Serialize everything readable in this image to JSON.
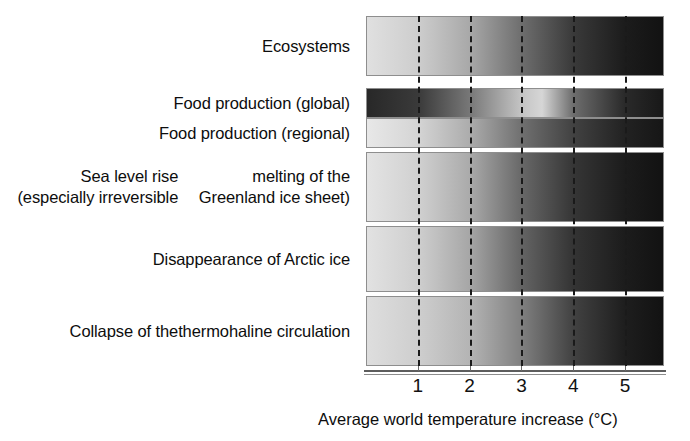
{
  "figure": {
    "type": "burning-embers-risk-diagram",
    "background": "#ffffff"
  },
  "axis": {
    "title": "Average world temperature increase (°C)",
    "tick_labels": [
      "1",
      "2",
      "3",
      "4",
      "5"
    ],
    "tick_values": [
      1,
      2,
      3,
      4,
      5
    ],
    "xlim": [
      0,
      5.75
    ],
    "unit": "°C",
    "gridline_style": "dashed",
    "gridline_color": "#1a1a1a",
    "axis_line_color": "#5d5d5d"
  },
  "rows": [
    {
      "label": "Ecosystems",
      "label_lines": [
        "Ecosystems"
      ],
      "top": 16,
      "height": 60
    },
    {
      "label": "Food production (global)",
      "label_lines": [
        "Food production (global)"
      ],
      "top": 88,
      "height": 30
    },
    {
      "label": "Food production (regional)",
      "label_lines": [
        "Food production (regional)"
      ],
      "top": 118,
      "height": 30
    },
    {
      "label": "Sea level rise (especially irreversible melting of the Greenland ice sheet)",
      "label_lines": [
        "Sea level rise (especially irreversible",
        "melting of the Greenland ice sheet)"
      ],
      "top": 152,
      "height": 70
    },
    {
      "label": "Disappearance of Arctic ice",
      "label_lines": [
        "Disappearance of Arctic ice"
      ],
      "top": 226,
      "height": 66
    },
    {
      "label": "Collapse of the thermohaline circulation",
      "label_lines": [
        "Collapse of the",
        "thermohaline circulation"
      ],
      "top": 296,
      "height": 70
    }
  ],
  "chart_data": {
    "type": "heatmap",
    "title": "",
    "subtitle": "",
    "xlabel": "Average world temperature increase (°C)",
    "ylabel": "",
    "xlim": [
      0,
      5.75
    ],
    "xticks": [
      1,
      2,
      3,
      4,
      5
    ],
    "xticklabels": [
      "1",
      "2",
      "3",
      "4",
      "5"
    ],
    "grid": true,
    "legend": "none",
    "colormap": "grayscale (light = low risk / benefit, dark = high risk)",
    "categories": [
      "Ecosystems",
      "Food production (global)",
      "Food production (regional)",
      "Sea level rise (especially irreversible melting of the Greenland ice sheet)",
      "Disappearance of Arctic ice",
      "Collapse of the thermohaline circulation"
    ],
    "series": [
      {
        "name": "Ecosystems",
        "gradient_stops": [
          {
            "x": 0.0,
            "gray": 224
          },
          {
            "x": 1.0,
            "gray": 205
          },
          {
            "x": 2.0,
            "gray": 168
          },
          {
            "x": 3.0,
            "gray": 110
          },
          {
            "x": 4.0,
            "gray": 58
          },
          {
            "x": 5.0,
            "gray": 28
          },
          {
            "x": 5.75,
            "gray": 18
          }
        ]
      },
      {
        "name": "Food production (global)",
        "gradient_stops": [
          {
            "x": 0.0,
            "gray": 40
          },
          {
            "x": 1.0,
            "gray": 58
          },
          {
            "x": 2.0,
            "gray": 120
          },
          {
            "x": 3.0,
            "gray": 196
          },
          {
            "x": 3.4,
            "gray": 214
          },
          {
            "x": 4.0,
            "gray": 110
          },
          {
            "x": 5.0,
            "gray": 42
          },
          {
            "x": 5.75,
            "gray": 24
          }
        ]
      },
      {
        "name": "Food production (regional)",
        "gradient_stops": [
          {
            "x": 0.0,
            "gray": 232
          },
          {
            "x": 1.0,
            "gray": 212
          },
          {
            "x": 2.0,
            "gray": 172
          },
          {
            "x": 3.0,
            "gray": 112
          },
          {
            "x": 4.0,
            "gray": 66
          },
          {
            "x": 5.0,
            "gray": 34
          },
          {
            "x": 5.75,
            "gray": 22
          }
        ]
      },
      {
        "name": "Sea level rise (especially irreversible melting of the Greenland ice sheet)",
        "gradient_stops": [
          {
            "x": 0.0,
            "gray": 228
          },
          {
            "x": 1.0,
            "gray": 208
          },
          {
            "x": 2.0,
            "gray": 170
          },
          {
            "x": 3.0,
            "gray": 104
          },
          {
            "x": 4.0,
            "gray": 54
          },
          {
            "x": 5.0,
            "gray": 28
          },
          {
            "x": 5.75,
            "gray": 18
          }
        ]
      },
      {
        "name": "Disappearance of Arctic ice",
        "gradient_stops": [
          {
            "x": 0.0,
            "gray": 226
          },
          {
            "x": 1.0,
            "gray": 206
          },
          {
            "x": 2.0,
            "gray": 166
          },
          {
            "x": 3.0,
            "gray": 100
          },
          {
            "x": 4.0,
            "gray": 52
          },
          {
            "x": 5.0,
            "gray": 28
          },
          {
            "x": 5.75,
            "gray": 18
          }
        ]
      },
      {
        "name": "Collapse of the thermohaline circulation",
        "gradient_stops": [
          {
            "x": 0.0,
            "gray": 222
          },
          {
            "x": 1.0,
            "gray": 206
          },
          {
            "x": 2.0,
            "gray": 180
          },
          {
            "x": 3.0,
            "gray": 128
          },
          {
            "x": 4.0,
            "gray": 66
          },
          {
            "x": 5.0,
            "gray": 30
          },
          {
            "x": 5.75,
            "gray": 18
          }
        ]
      }
    ]
  }
}
